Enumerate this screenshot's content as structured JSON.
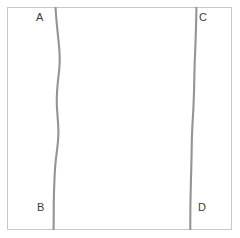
{
  "figure": {
    "title": "",
    "background_color": "#ffffff",
    "frame": {
      "name": "plot-border",
      "border_color": "#c8c8c8",
      "x": 7,
      "y": 7,
      "width": 225,
      "height": 223
    },
    "curve_color": "#949494",
    "curve_width": 2.1,
    "labels": {
      "a": "A",
      "b": "B",
      "c": "C",
      "d": "D"
    },
    "curves": [
      {
        "name": "left-curve",
        "endpoints": [
          "A",
          "B"
        ],
        "path": "M 55.5 7 C 56.2 20 57.5 30 58.6 42 C 59.8 52 60.2 60 59.2 70 C 57.8 82 56.4 92 56.8 104 C 57.2 116 58.6 124 58.4 134 C 58.1 146 56.2 154 55.2 166 C 54.4 178 54.0 190 53.8 202 C 53.7 214 53.6 224 53.6 230"
      },
      {
        "name": "right-curve",
        "endpoints": [
          "C",
          "D"
        ],
        "path": "M 196.4 7 C 196.3 18 196.0 28 195.6 40 C 195.2 52 194.6 62 194.4 74 C 194.2 86 194.0 96 193.4 108 C 192.8 120 192.0 130 191.8 142 C 191.6 154 191.4 166 191.0 178 C 190.7 190 190.4 204 190.3 216 C 190.3 224 190.3 228 190.3 230"
      }
    ]
  }
}
